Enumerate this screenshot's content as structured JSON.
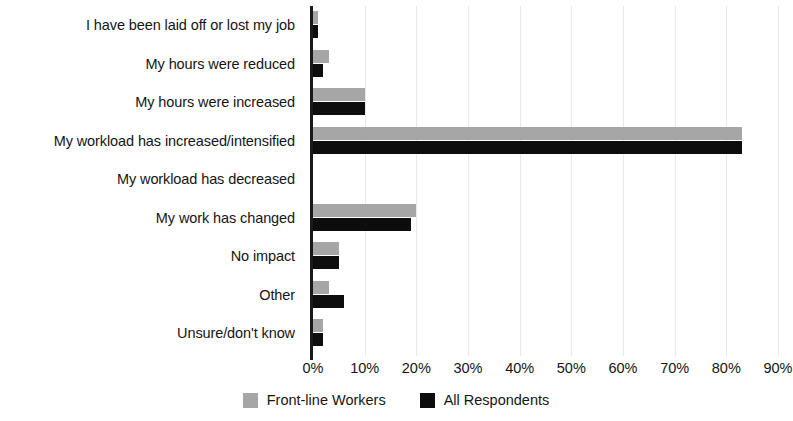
{
  "chart_data": {
    "type": "bar",
    "orientation": "horizontal",
    "title": "",
    "subtitle": "",
    "xlabel": "",
    "ylabel": "",
    "xlim": [
      0,
      90
    ],
    "xtick_labels": [
      "0%",
      "10%",
      "20%",
      "30%",
      "40%",
      "50%",
      "60%",
      "70%",
      "80%",
      "90%"
    ],
    "xtick_values": [
      0,
      10,
      20,
      30,
      40,
      50,
      60,
      70,
      80,
      90
    ],
    "grid": "vertical",
    "legend_position": "bottom-center",
    "categories": [
      "I have been laid off or lost my job",
      "My hours were reduced",
      "My hours were increased",
      "My workload has increased/intensified",
      "My workload has decreased",
      "My work has changed",
      "No impact",
      "Other",
      "Unsure/don't know"
    ],
    "series": [
      {
        "name": "Front-line Workers",
        "color": "#a6a6a6",
        "values": [
          1,
          3,
          10,
          83,
          0,
          20,
          5,
          3,
          2
        ]
      },
      {
        "name": "All Respondents",
        "color": "#0d0d0d",
        "values": [
          1,
          2,
          10,
          83,
          0,
          19,
          5,
          6,
          2
        ]
      }
    ]
  },
  "colors": {
    "front_line_workers": "#a6a6a6",
    "all_respondents": "#0d0d0d",
    "axis": "#1a1a1a",
    "gridline": "#e9e9e9",
    "background": "#ffffff",
    "text": "#151515"
  }
}
